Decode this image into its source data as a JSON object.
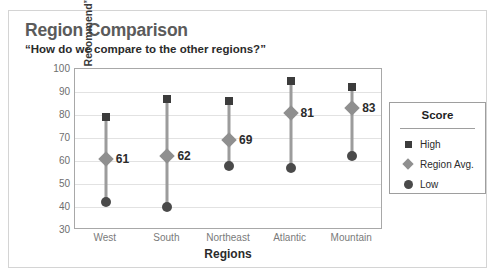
{
  "chart_data": {
    "type": "scatter",
    "title": "Region Comparison",
    "subtitle": "“How do we compare to the other regions?”",
    "xlabel": "Regions",
    "ylabel": "“Likelihood to Recommend”",
    "ylim": [
      30,
      100
    ],
    "ytick_step": 10,
    "yticks": [
      "100",
      "90",
      "80",
      "70",
      "60",
      "50",
      "40",
      "30"
    ],
    "grid": true,
    "legend_position": "right",
    "legend_title": "Score",
    "categories": [
      "West",
      "South",
      "Northeast",
      "Atlantic",
      "Mountain"
    ],
    "series": [
      {
        "name": "High",
        "marker": "square",
        "color": "#3c3c3c",
        "values": [
          79,
          87,
          86,
          95,
          92
        ]
      },
      {
        "name": "Region Avg.",
        "marker": "diamond",
        "color": "#8f8f8f",
        "values": [
          61,
          62,
          69,
          81,
          83
        ]
      },
      {
        "name": "Low",
        "marker": "circle",
        "color": "#4a4a4a",
        "values": [
          42,
          40,
          58,
          57,
          62
        ]
      }
    ],
    "data_labels": [
      "61",
      "62",
      "69",
      "81",
      "83"
    ]
  },
  "legend": {
    "title": "Score",
    "items": [
      {
        "label": "High",
        "icon": "square-marker-icon"
      },
      {
        "label": "Region Avg.",
        "icon": "diamond-marker-icon"
      },
      {
        "label": "Low",
        "icon": "circle-marker-icon"
      }
    ]
  }
}
